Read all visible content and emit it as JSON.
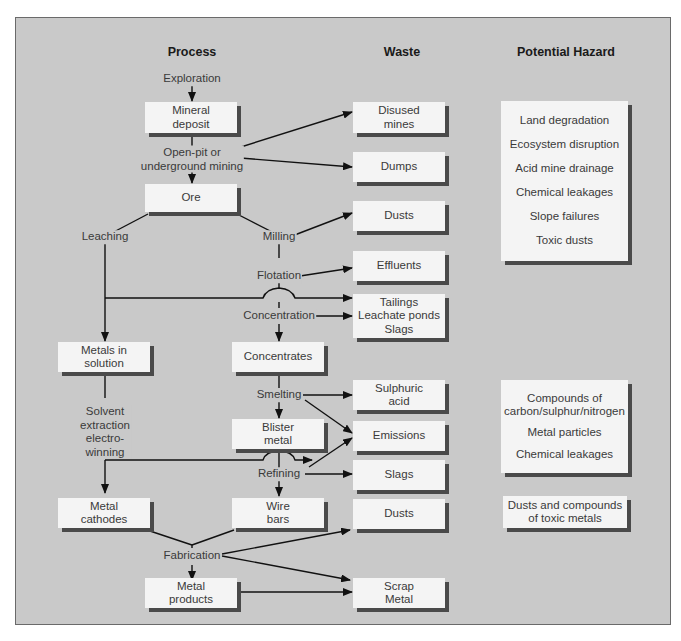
{
  "headers": {
    "process": "Process",
    "waste": "Waste",
    "hazard": "Potential Hazard"
  },
  "process": {
    "exploration": "Exploration",
    "mineral_deposit": "Mineral\ndeposit",
    "mining": "Open-pit or\nunderground mining",
    "ore": "Ore",
    "leaching": "Leaching",
    "milling": "Milling",
    "flotation": "Flotation",
    "concentration": "Concentration",
    "metals_in_solution": "Metals in\nsolution",
    "concentrates": "Concentrates",
    "solvent_extraction": "Solvent\nextraction\nelectro-\nwinning",
    "smelting": "Smelting",
    "blister_metal": "Blister\nmetal",
    "refining": "Refining",
    "metal_cathodes": "Metal\ncathodes",
    "wire_bars": "Wire\nbars",
    "fabrication": "Fabrication",
    "metal_products": "Metal\nproducts"
  },
  "waste": {
    "disused_mines": "Disused\nmines",
    "dumps": "Dumps",
    "dusts_1": "Dusts",
    "effluents": "Effluents",
    "tailings": "Tailings\nLeachate ponds\nSlags",
    "sulphuric_acid": "Sulphuric\nacid",
    "emissions": "Emissions",
    "slags": "Slags",
    "dusts_2": "Dusts",
    "scrap_metal": "Scrap\nMetal"
  },
  "hazards": {
    "group1": [
      "Land degradation",
      "Ecosystem disruption",
      "Acid mine drainage",
      "Chemical leakages",
      "Slope failures",
      "Toxic dusts"
    ],
    "group2": [
      "Compounds of\ncarbon/sulphur/nitrogen",
      "Metal particles",
      "Chemical leakages"
    ],
    "group3": [
      "Dusts and compounds\nof toxic metals"
    ]
  },
  "colors": {
    "panel": "#c9c9c9",
    "box": "#f4f4f4",
    "shadow": "#4a4a4a",
    "line": "#111111"
  }
}
